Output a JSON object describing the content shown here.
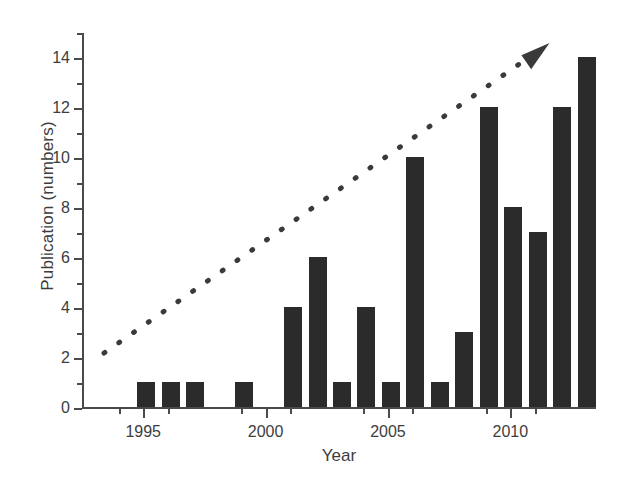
{
  "chart_data": {
    "type": "bar",
    "title": "",
    "xlabel": "Year",
    "ylabel": "Publication (numbers)",
    "categories": [
      1993,
      1994,
      1995,
      1996,
      1997,
      1998,
      1999,
      2000,
      2001,
      2002,
      2003,
      2004,
      2005,
      2006,
      2007,
      2008,
      2009,
      2010,
      2011,
      2012,
      2013
    ],
    "values": [
      0,
      0,
      1,
      1,
      1,
      0,
      1,
      0,
      4,
      6,
      1,
      4,
      1,
      10,
      1,
      3,
      12,
      8,
      7,
      12,
      14
    ],
    "series": [
      {
        "name": "Publications",
        "values": [
          0,
          0,
          1,
          1,
          1,
          0,
          1,
          0,
          4,
          6,
          1,
          4,
          1,
          10,
          1,
          3,
          12,
          8,
          7,
          12,
          14
        ]
      }
    ],
    "bar_color": "#2b2b2b",
    "xlim": [
      1992.5,
      2013.5
    ],
    "ylim": [
      0,
      15
    ],
    "yticks_major": [
      0,
      2,
      4,
      6,
      8,
      10,
      12,
      14
    ],
    "yticks_minor": [
      1,
      3,
      5,
      7,
      9,
      11,
      13,
      15
    ],
    "ytick_labels": [
      "0",
      "2",
      "4",
      "6",
      "8",
      "10",
      "12",
      "14"
    ],
    "xticks_major": [
      1995,
      2000,
      2005,
      2010
    ],
    "xticks_minor": [
      1994,
      1996,
      1999,
      2001,
      2004,
      2006,
      2009,
      2011
    ],
    "xtick_labels": [
      "1995",
      "2000",
      "2005",
      "2010"
    ],
    "grid": false,
    "legend": "none",
    "annotations": [
      {
        "type": "arrow",
        "name": "increasing-trend-arrow",
        "style": "dotted-line-with-arrowhead",
        "color": "#3a3a3a",
        "start": {
          "x": 1993.4,
          "y": 2.2
        },
        "end": {
          "x": 2011.6,
          "y": 14.6
        }
      }
    ]
  }
}
